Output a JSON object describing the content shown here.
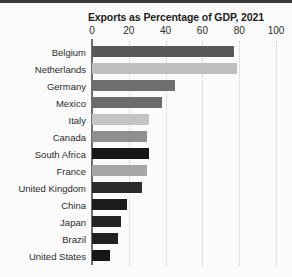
{
  "chart_data": {
    "type": "bar",
    "orientation": "horizontal",
    "title": "Exports as Percentage of GDP, 2021",
    "xlabel": "",
    "ylabel": "",
    "xlim": [
      0,
      100
    ],
    "xticks": [
      0,
      20,
      40,
      60,
      80,
      100
    ],
    "grid": "vertical-dotted",
    "legend": "none",
    "categories": [
      "Belgium",
      "Netherlands",
      "Germany",
      "Mexico",
      "Italy",
      "Canada",
      "South Africa",
      "France",
      "United Kingdom",
      "China",
      "Japan",
      "Brazil",
      "United States"
    ],
    "values": [
      77,
      79,
      45,
      38,
      31,
      30,
      31,
      30,
      27,
      19,
      16,
      14,
      10
    ],
    "bar_colors": [
      "#595959",
      "#bfbfbf",
      "#6e6e6e",
      "#6b6b6b",
      "#c4c4c4",
      "#8f8f8f",
      "#171717",
      "#a6a6a6",
      "#2b2b2b",
      "#1c1c1c",
      "#232323",
      "#222222",
      "#161616"
    ]
  },
  "style": {
    "background": "#fbfbfb",
    "axis_color": "#6f6f6f",
    "grid_color": "#c9c9c9",
    "text_color": "#2b2b2b",
    "title_color": "#1b1b1b",
    "top_band_color": "#3b3b3d"
  }
}
